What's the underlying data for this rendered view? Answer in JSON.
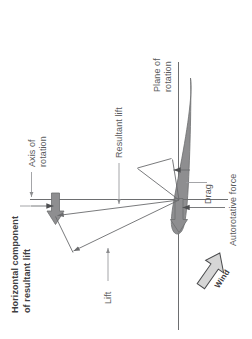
{
  "figure": {
    "orientation": "rotated-90-ccw",
    "background_color": "#ffffff"
  },
  "labels": {
    "plane_of_rotation_line1": "Plane of",
    "plane_of_rotation_line2": "rotation",
    "axis_of_rotation_line1": "Axis of",
    "axis_of_rotation_line2": "rotation",
    "resultant_lift": "Resultant lift",
    "horizontal_component_line1": "Horizontal component",
    "horizontal_component_line2": "of resultant lift",
    "lift": "Lift",
    "drag": "Drag",
    "autorotative_force": "Autorotative force",
    "wind": "Wind"
  },
  "colors": {
    "text": "#58595b",
    "text_bold": "#3f4042",
    "blade_fill": "#8e8e90",
    "blade_stroke": "#6d6e70",
    "thick_arrow_fill": "#8e8e90",
    "thick_arrow_stroke": "#6d6e70",
    "thin_line": "#77787b",
    "leader_line": "#9a9b9e",
    "wind_arrow_fill": "#d6d6d6",
    "wind_arrow_stroke": "#4a4b4d",
    "axis_line": "#6d6e70"
  },
  "elements": {
    "blade_name": "rotor-blade-airfoil",
    "plane_of_rotation_axis": "vertical-line",
    "axis_of_rotation_axis": "horizontal-line",
    "vectors": [
      "resultant-lift-vector",
      "lift-vector",
      "horizontal-component-vector",
      "drag-vector",
      "autorotative-force-vector"
    ]
  }
}
